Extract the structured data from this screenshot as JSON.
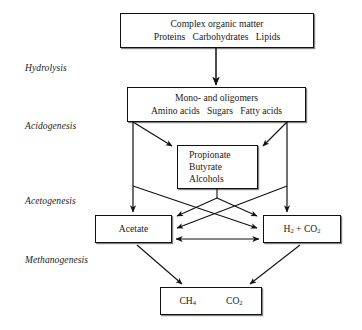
{
  "diagram": {
    "type": "flow-diagram",
    "background_color": "#ffffff",
    "line_color": "#111111"
  },
  "stages": [
    {
      "id": "hydrolysis",
      "label": "Hydrolysis"
    },
    {
      "id": "acidogenesis",
      "label": "Acidogenesis"
    },
    {
      "id": "acetogenesis",
      "label": "Acetogenesis"
    },
    {
      "id": "methanogenesis",
      "label": "Methanogenesis"
    }
  ],
  "nodes": {
    "complex_organic_matter": {
      "line1": "Complex organic matter",
      "line2_a": "Proteins",
      "line2_b": "Carbohydrates",
      "line2_c": "Lipids"
    },
    "monomers": {
      "line1": "Mono- and oligomers",
      "line2_a": "Amino acids",
      "line2_b": "Sugars",
      "line2_c": "Fatty acids"
    },
    "intermediates": {
      "line1": "Propionate",
      "line2": "Butyrate",
      "line3": "Alcohols"
    },
    "acetate": {
      "label": "Acetate"
    },
    "hydrogen_co2": {
      "label_h": "H",
      "label_h_sub": "2",
      "label_plus": " + CO",
      "label_co2_sub": "2"
    },
    "methane_co2": {
      "label_ch4": "CH",
      "label_ch4_sub": "4",
      "label_co2": "CO",
      "label_co2_sub": "2"
    }
  }
}
